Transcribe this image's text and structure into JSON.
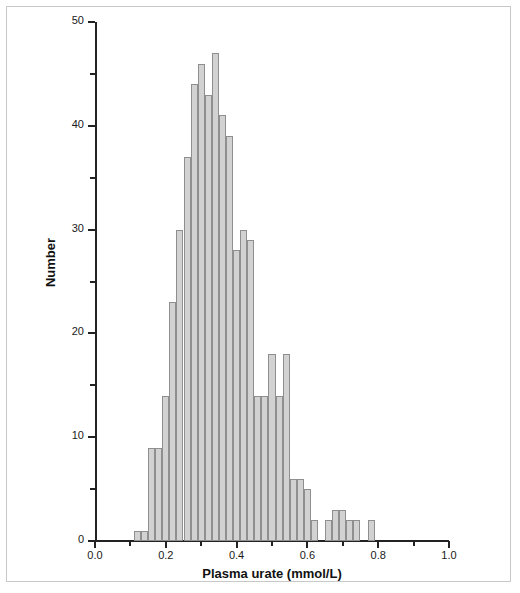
{
  "figure": {
    "frame_border_color": "#c8c8c8",
    "background": "#ffffff"
  },
  "axes": {
    "y_title": "Number",
    "x_title": "Plasma urate (mmol/L)",
    "y_ticks_major": [
      "0",
      "10",
      "20",
      "30",
      "40",
      "50"
    ],
    "x_ticks_major": [
      "0.0",
      "0.2",
      "0.4",
      "0.6",
      "0.8",
      "1.0"
    ]
  },
  "style": {
    "bar_fill": "#d2d2d2",
    "bar_stroke": "#8f8f8f",
    "axis_color": "#222222",
    "text_color": "#1a1a1a"
  },
  "chart_data": {
    "type": "bar",
    "title": "",
    "subtitle": "",
    "xlabel": "Plasma urate (mmol/L)",
    "ylabel": "Number",
    "xlim": [
      0.0,
      1.0
    ],
    "ylim": [
      0,
      50
    ],
    "grid": false,
    "legend": null,
    "bin_width": 0.02,
    "x_tick_labels": [
      "0.0",
      "0.2",
      "0.4",
      "0.6",
      "0.8",
      "1.0"
    ],
    "x_tick_values": [
      0.0,
      0.2,
      0.4,
      0.6,
      0.8,
      1.0
    ],
    "x_minor_tick_values": [
      0.1,
      0.3,
      0.5,
      0.7,
      0.9
    ],
    "y_tick_labels": [
      "0",
      "10",
      "20",
      "30",
      "40",
      "50"
    ],
    "y_tick_values": [
      0,
      10,
      20,
      30,
      40,
      50
    ],
    "y_minor_tick_values": [
      5,
      15,
      25,
      35,
      45
    ],
    "bin_starts": [
      0.11,
      0.13,
      0.15,
      0.17,
      0.19,
      0.21,
      0.23,
      0.25,
      0.27,
      0.29,
      0.31,
      0.33,
      0.35,
      0.37,
      0.39,
      0.41,
      0.43,
      0.45,
      0.47,
      0.49,
      0.51,
      0.53,
      0.55,
      0.57,
      0.59,
      0.61,
      0.63,
      0.65,
      0.67,
      0.69,
      0.71,
      0.73,
      0.75,
      0.77
    ],
    "categories": [
      "0.11",
      "0.13",
      "0.15",
      "0.17",
      "0.19",
      "0.21",
      "0.23",
      "0.25",
      "0.27",
      "0.29",
      "0.31",
      "0.33",
      "0.35",
      "0.37",
      "0.39",
      "0.41",
      "0.43",
      "0.45",
      "0.47",
      "0.49",
      "0.51",
      "0.53",
      "0.55",
      "0.57",
      "0.59",
      "0.61",
      "0.63",
      "0.65",
      "0.67",
      "0.69",
      "0.71",
      "0.73",
      "0.75",
      "0.77"
    ],
    "values": [
      1,
      1,
      9,
      9,
      14,
      23,
      30,
      37,
      44,
      46,
      43,
      47,
      41,
      39,
      28,
      30,
      29,
      14,
      14,
      18,
      14,
      18,
      6,
      6,
      5,
      2,
      0,
      2,
      3,
      3,
      2,
      2,
      0,
      2
    ]
  }
}
